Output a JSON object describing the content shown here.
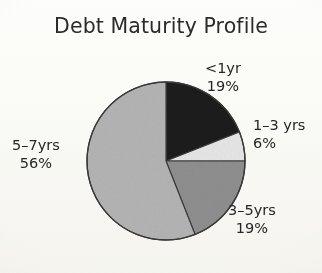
{
  "chart_data": {
    "type": "pie",
    "title": "Debt Maturity Profile",
    "subtitle": "",
    "xlabel": "",
    "ylabel": "",
    "legend_position": "none",
    "grid": false,
    "units": "percent",
    "total": 100,
    "categories": [
      "<1yr",
      "1–3 yrs",
      "3–5yrs",
      "5–7yrs"
    ],
    "values": [
      19,
      6,
      19,
      56
    ],
    "value_labels": [
      "19%",
      "6%",
      "19%",
      "56%"
    ],
    "colors": [
      "#1c1c1c",
      "#e6e6e6",
      "#8f8f8f",
      "#b4b4b4"
    ],
    "start_angle_deg": 0,
    "direction": "clockwise",
    "slices": [
      {
        "name": "<1yr",
        "value": 19,
        "value_label": "19%",
        "color": "#1c1c1c",
        "start_deg": 0.0,
        "end_deg": 68.4,
        "label_position": "outside-top-right"
      },
      {
        "name": "1–3 yrs",
        "value": 6,
        "value_label": "6%",
        "color": "#e6e6e6",
        "start_deg": 68.4,
        "end_deg": 90.0,
        "label_position": "outside-right"
      },
      {
        "name": "3–5yrs",
        "value": 19,
        "value_label": "19%",
        "color": "#8f8f8f",
        "start_deg": 90.0,
        "end_deg": 158.4,
        "label_position": "outside-bottom-right"
      },
      {
        "name": "5–7yrs",
        "value": 56,
        "value_label": "56%",
        "color": "#b4b4b4",
        "start_deg": 158.4,
        "end_deg": 360.0,
        "label_position": "outside-left"
      }
    ]
  },
  "figure": {
    "title": "Debt Maturity Profile",
    "background_color": "#fdfdfb",
    "outline_color": "#3a3a3a",
    "text_color": "#262626"
  },
  "labels": {
    "lt1yr": {
      "name": "<1yr",
      "value": "19%"
    },
    "y1to3": {
      "name": "1–3 yrs",
      "value": "6%"
    },
    "y3to5": {
      "name": "3–5yrs",
      "value": "19%"
    },
    "y5to7": {
      "name": "5–7yrs",
      "value": "56%"
    }
  }
}
